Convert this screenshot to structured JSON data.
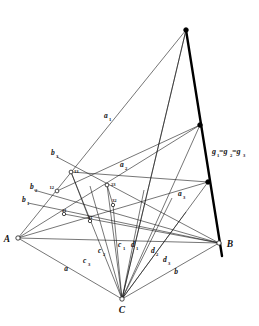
{
  "figure": {
    "background_color": "#ffffff",
    "line_color": "#1a1a1a",
    "axis_color": "#000000"
  },
  "vertices": [
    {
      "id": "A",
      "label": "A",
      "x": 18,
      "y": 238,
      "marker": "open"
    },
    {
      "id": "B",
      "label": "B",
      "x": 219,
      "y": 243,
      "marker": "open"
    },
    {
      "id": "C",
      "label": "C",
      "x": 122,
      "y": 299,
      "marker": "open"
    }
  ],
  "axis": {
    "name": "g",
    "label_main": "g",
    "label_sub1": "1",
    "label_eq1": "=g",
    "label_sub2": "2",
    "label_eq2": "=g",
    "label_sub3": "3",
    "label_text": "g1=g2=g3",
    "top_x": 186,
    "top_y": 30,
    "bottom_x": 222,
    "bottom_y": 256,
    "points": [
      {
        "id": "G1",
        "x": 186,
        "y": 30,
        "marker": "solid"
      },
      {
        "id": "G2",
        "x": 200,
        "y": 125,
        "marker": "solid"
      },
      {
        "id": "G3",
        "x": 208,
        "y": 182,
        "marker": "solid"
      }
    ]
  },
  "pencil_a": {
    "labels": [
      {
        "text": "a",
        "sub": "1",
        "x": 104,
        "y": 118
      },
      {
        "text": "a",
        "sub": "2",
        "x": 120,
        "y": 167
      },
      {
        "text": "a",
        "sub": "3",
        "x": 178,
        "y": 196
      }
    ]
  },
  "pencil_b": {
    "labels": [
      {
        "text": "b",
        "sub": "3",
        "x": 51,
        "y": 155
      },
      {
        "text": "b",
        "sub": "2",
        "x": 30,
        "y": 189
      },
      {
        "text": "b",
        "sub": "1",
        "x": 22,
        "y": 202
      }
    ]
  },
  "pencil_c": {
    "labels": [
      {
        "text": "c",
        "sub": "3",
        "x": 83,
        "y": 263
      },
      {
        "text": "c",
        "sub": "2",
        "x": 98,
        "y": 253
      },
      {
        "text": "c",
        "sub": "1",
        "x": 118,
        "y": 247
      }
    ]
  },
  "pencil_d": {
    "labels": [
      {
        "text": "d",
        "sub": "1",
        "x": 131,
        "y": 247
      },
      {
        "text": "d",
        "sub": "2",
        "x": 151,
        "y": 253
      },
      {
        "text": "d",
        "sub": "3",
        "x": 163,
        "y": 262
      }
    ]
  },
  "side_labels": [
    {
      "text": "a",
      "x": 66,
      "y": 271
    },
    {
      "text": "b",
      "x": 176,
      "y": 274
    }
  ],
  "intersection_points": [
    {
      "label": "13",
      "x": 71,
      "y": 172,
      "marker": "open"
    },
    {
      "label": "12",
      "x": 57,
      "y": 191,
      "marker": "open"
    },
    {
      "label": "23",
      "x": 107,
      "y": 185,
      "marker": "open"
    },
    {
      "label": "32",
      "x": 113,
      "y": 205,
      "marker": "open"
    },
    {
      "label": "21",
      "x": 64,
      "y": 214,
      "marker": "open"
    },
    {
      "label": "31",
      "x": 90,
      "y": 221,
      "marker": "open"
    }
  ]
}
